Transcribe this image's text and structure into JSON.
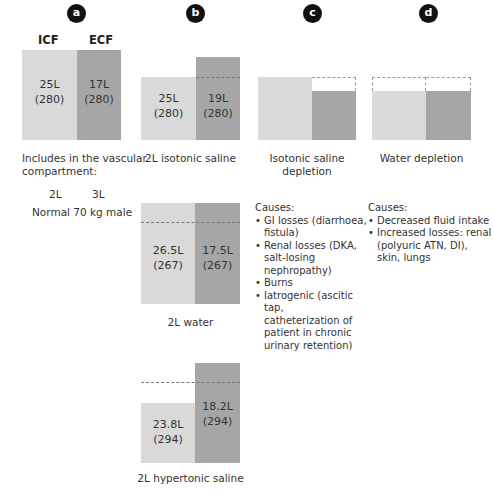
{
  "panels": {
    "a": {
      "badge": "a",
      "headers": {
        "icf": "ICF",
        "ecf": "ECF"
      },
      "icf": {
        "volume": "25L",
        "osm": "(280)"
      },
      "ecf": {
        "volume": "17L",
        "osm": "(280)"
      },
      "note_line1": "Includes in the vascular",
      "note_line2": "compartment:",
      "vascular_icf": "2L",
      "vascular_ecf": "3L",
      "caption": "Normal 70 kg male"
    },
    "b": {
      "badge": "b",
      "isotonic": {
        "icf": {
          "volume": "25L",
          "osm": "(280)"
        },
        "ecf": {
          "volume": "19L",
          "osm": "(280)"
        },
        "caption": "2L isotonic saline"
      },
      "water": {
        "icf": {
          "volume": "26.5L",
          "osm": "(267)"
        },
        "ecf": {
          "volume": "17.5L",
          "osm": "(267)"
        },
        "caption": "2L water"
      },
      "hypertonic": {
        "icf": {
          "volume": "23.8L",
          "osm": "(294)"
        },
        "ecf": {
          "volume": "18.2L",
          "osm": "(294)"
        },
        "caption": "2L hypertonic saline"
      }
    },
    "c": {
      "badge": "c",
      "caption_line1": "Isotonic saline",
      "caption_line2": "depletion",
      "causes_title": "Causes:",
      "causes": [
        [
          "GI losses (diarrhoea,",
          "fistula)"
        ],
        [
          "Renal losses (DKA,",
          "salt-losing",
          "nephropathy)"
        ],
        [
          "Burns"
        ],
        [
          "Iatrogenic (ascitic tap,",
          "catheterization of",
          "patient in chronic",
          "urinary retention)"
        ]
      ]
    },
    "d": {
      "badge": "d",
      "caption": "Water depletion",
      "causes_title": "Causes:",
      "causes": [
        [
          "Decreased fluid intake"
        ],
        [
          "Increased losses: renal",
          "(polyuric ATN, DI),",
          "skin, lungs"
        ]
      ]
    }
  },
  "colors": {
    "icf": "#d9d9d9",
    "ecf": "#a6a6a6",
    "badge": "#111111",
    "dashed": "#777777"
  }
}
